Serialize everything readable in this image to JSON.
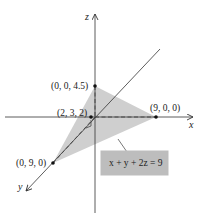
{
  "diagram": {
    "axes": {
      "x_label": "x",
      "y_label": "y",
      "z_label": "z"
    },
    "points": [
      {
        "label": "(0, 0, 4.5)",
        "role": "z-intercept"
      },
      {
        "label": "(9, 0, 0)",
        "role": "x-intercept"
      },
      {
        "label": "(0, 9, 0)",
        "role": "y-intercept"
      },
      {
        "label": "(2, 3, 2)",
        "role": "foot-of-perpendicular"
      }
    ],
    "plane": {
      "equation": "x + y + 2z = 9",
      "fill_color": "#c8c8c8"
    },
    "callout_box_color": "#bdbdbd",
    "line_color": "#333333"
  }
}
